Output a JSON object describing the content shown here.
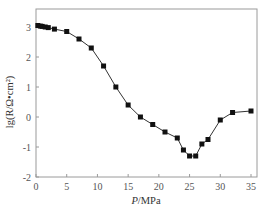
{
  "chart_data": {
    "type": "line",
    "title": "",
    "xlabel_italic": "P",
    "xlabel_unit": "/MPa",
    "xlabel": "P/MPa",
    "ylabel": "lg(R/Ω•cm²)",
    "xlim": [
      0,
      35
    ],
    "ylim": [
      -2,
      3.5
    ],
    "xticks": [
      0,
      5,
      10,
      15,
      20,
      25,
      30,
      35
    ],
    "yticks": [
      -2,
      -1,
      0,
      1,
      2,
      3
    ],
    "grid": false,
    "legend": null,
    "marker": "square",
    "series": [
      {
        "name": "lg R",
        "x": [
          0.3,
          0.7,
          1,
          1.5,
          2,
          3,
          5,
          7,
          9,
          11,
          13,
          15,
          17,
          19,
          21,
          23,
          24,
          25,
          26,
          27,
          28,
          30,
          32,
          35
        ],
        "y": [
          3.05,
          3.03,
          3.02,
          3.0,
          2.98,
          2.93,
          2.85,
          2.6,
          2.3,
          1.7,
          1.0,
          0.4,
          0.0,
          -0.25,
          -0.5,
          -0.7,
          -1.1,
          -1.3,
          -1.3,
          -0.9,
          -0.75,
          -0.1,
          0.15,
          0.2
        ]
      }
    ]
  },
  "colors": {
    "axis": "#9a9a9a",
    "line": "#333333",
    "marker": "#111111"
  }
}
